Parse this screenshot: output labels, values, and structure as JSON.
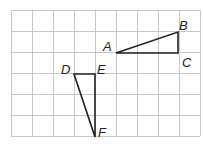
{
  "grid": {
    "cols": 9,
    "rows": 6,
    "cell": 21,
    "origin_x": 11,
    "origin_y": 10,
    "line_color": "#c8c8c8"
  },
  "triangles": [
    {
      "name": "ABC",
      "points": [
        [
          5,
          2
        ],
        [
          8,
          1
        ],
        [
          8,
          2
        ]
      ]
    },
    {
      "name": "DEF",
      "points": [
        [
          3,
          3
        ],
        [
          4,
          3
        ],
        [
          4,
          6
        ]
      ]
    }
  ],
  "labels": {
    "A": "A",
    "B": "B",
    "C": "C",
    "D": "D",
    "E": "E",
    "F": "F"
  }
}
